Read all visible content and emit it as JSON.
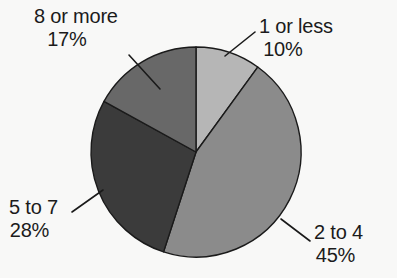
{
  "chart_data": {
    "type": "pie",
    "title": "",
    "subtitle": "",
    "xlabel": "",
    "ylabel": "",
    "legend_position": "none",
    "grid": false,
    "start_angle_deg": 0,
    "direction": "clockwise",
    "center": {
      "x": 196,
      "y": 152
    },
    "radius": 105,
    "background_color": "#f8f8f7",
    "outline_color": "#1a1a1a",
    "categories": [
      "1 or less",
      "2 to 4",
      "5 to 7",
      "8 or more"
    ],
    "values": [
      10,
      45,
      28,
      17
    ],
    "value_labels": [
      "10%",
      "45%",
      "28%",
      "17%"
    ],
    "colors": [
      "#b6b6b6",
      "#8b8b8b",
      "#3b3b3b",
      "#686868"
    ],
    "slices": [
      {
        "label": "1 or less",
        "value": 10,
        "value_label": "10%",
        "color": "#b6b6b6",
        "start_deg": 0,
        "end_deg": 36
      },
      {
        "label": "2 to 4",
        "value": 45,
        "value_label": "45%",
        "color": "#8b8b8b",
        "start_deg": 36,
        "end_deg": 198
      },
      {
        "label": "5 to 7",
        "value": 28,
        "value_label": "28%",
        "color": "#3b3b3b",
        "start_deg": 198,
        "end_deg": 298.8
      },
      {
        "label": "8 or more",
        "value": 17,
        "value_label": "17%",
        "color": "#686868",
        "start_deg": 298.8,
        "end_deg": 360
      }
    ]
  },
  "labels": {
    "eight_or_more": {
      "name": "8 or more",
      "percent": "17%"
    },
    "one_or_less": {
      "name": "1 or less",
      "percent": "10%"
    },
    "five_to_seven": {
      "name": "5 to 7",
      "percent": "28%"
    },
    "two_to_four": {
      "name": "2 to 4",
      "percent": "45%"
    }
  }
}
